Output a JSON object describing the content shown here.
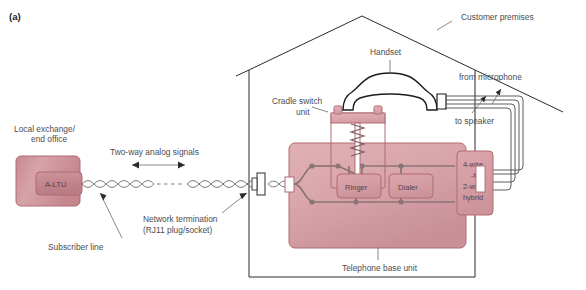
{
  "figure": {
    "panel_tag": "(a)",
    "caption_region": "telephone-subscriber-loop-diagram"
  },
  "labels": {
    "customer_premises": "Customer premises",
    "local_exchange": "Local exchange/",
    "end_office": "end office",
    "altu": "A-LTU",
    "subscriber_line": "Subscriber line",
    "two_way": "Two-way analog signals",
    "network_termination": "Network termination",
    "rj11": "(RJ11 plug/socket)",
    "handset": "Handset",
    "cradle_switch": "Cradle switch",
    "cradle_unit": "unit",
    "from_microphone": "from microphone",
    "to_speaker": "to speaker",
    "ringer": "Ringer",
    "dialer": "Dialer",
    "hybrid_line1": "4-wire",
    "hybrid_line2": "-to-",
    "hybrid_line3": "2-wire",
    "hybrid_line4": "hybrid",
    "telephone_base_unit": "Telephone base unit"
  },
  "colors": {
    "exchange_fill": "#cf9aa0",
    "altu_fill": "#c98f96",
    "base_unit_fill": "#dba9ae",
    "component_fill": "#d8a0a6",
    "box_stroke": "#b06b72",
    "wire": "#8a7478",
    "outline": "#2b2b2b",
    "text": "#4c4c50",
    "text_inner": "#5a4044",
    "background": "#ffffff"
  }
}
